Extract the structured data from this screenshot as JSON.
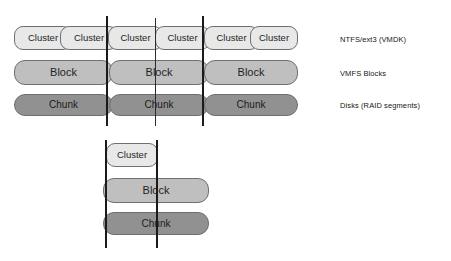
{
  "diagram": {
    "colors": {
      "cluster_fill": "#e8e8e8",
      "block_fill": "#bfbfbf",
      "chunk_fill": "#919191",
      "stroke": "#6f6f6f",
      "boundary_line": "#1a1a1a",
      "background": "#ffffff",
      "text": "#161616"
    },
    "top_section": {
      "cluster_row": {
        "layer_name": "cluster",
        "cells": [
          {
            "label": "Cluster"
          },
          {
            "label": "Cluster"
          },
          {
            "label": "Cluster"
          },
          {
            "label": "Cluster"
          },
          {
            "label": "Cluster"
          },
          {
            "label": "Cluster"
          }
        ]
      },
      "block_row": {
        "layer_name": "block",
        "cells": [
          {
            "label": "Block"
          },
          {
            "label": "Block"
          },
          {
            "label": "Block"
          }
        ]
      },
      "chunk_row": {
        "layer_name": "chunk",
        "cells": [
          {
            "label": "Chunk"
          },
          {
            "label": "Chunk"
          },
          {
            "label": "Chunk"
          }
        ]
      },
      "boundaries": [
        {
          "name": "boundary-left"
        },
        {
          "name": "boundary-middle-tick"
        },
        {
          "name": "boundary-right"
        }
      ]
    },
    "legend": {
      "items": [
        {
          "label": "NTFS/ext3 (VMDK)"
        },
        {
          "label": "VMFS Blocks"
        },
        {
          "label": "Disks (RAID segments)"
        }
      ]
    },
    "bottom_section": {
      "cluster": {
        "label": "Cluster"
      },
      "block": {
        "label": "Block"
      },
      "chunk": {
        "label": "Chunk"
      },
      "boundaries": [
        {
          "name": "boundary-left"
        },
        {
          "name": "boundary-right"
        }
      ]
    }
  }
}
